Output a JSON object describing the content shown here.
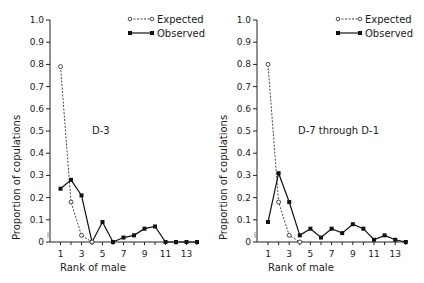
{
  "chart_data": [
    {
      "type": "line",
      "panel_label": "D-3",
      "xlabel": "Rank of male",
      "ylabel": "Proportion of copulations",
      "ylim": [
        0,
        1.0
      ],
      "xlim": [
        1,
        14
      ],
      "yticks": [
        "0",
        "0.1",
        "0.2",
        "0.3",
        "0.4",
        "0.5",
        "0.6",
        "0.7",
        "0.8",
        "0.9",
        "1.0"
      ],
      "xticks": [
        "1",
        "3",
        "5",
        "7",
        "9",
        "11",
        "13"
      ],
      "legend": [
        "Expected",
        "Observed"
      ],
      "legend_position": "upper right",
      "grid": false,
      "series": [
        {
          "name": "Expected",
          "style": "dashed, open circles",
          "x": [
            1,
            2,
            3,
            4
          ],
          "values": [
            0.79,
            0.18,
            0.03,
            0.0
          ]
        },
        {
          "name": "Observed",
          "style": "solid, filled squares",
          "x": [
            1,
            2,
            3,
            4,
            5,
            6,
            7,
            8,
            9,
            10,
            11,
            12,
            13,
            14
          ],
          "values": [
            0.24,
            0.28,
            0.21,
            0.0,
            0.09,
            0.0,
            0.02,
            0.03,
            0.06,
            0.07,
            0.0,
            0.0,
            0.0,
            0.0
          ]
        }
      ]
    },
    {
      "type": "line",
      "panel_label": "D-7 through D-1",
      "xlabel": "Rank of male",
      "ylabel": "Proportion of copulations",
      "ylim": [
        0,
        1.0
      ],
      "xlim": [
        1,
        14
      ],
      "yticks": [
        "0",
        "0.1",
        "0.2",
        "0.3",
        "0.4",
        "0.5",
        "0.6",
        "0.7",
        "0.8",
        "0.9",
        "1.0"
      ],
      "xticks": [
        "1",
        "3",
        "5",
        "7",
        "9",
        "11",
        "13"
      ],
      "legend": [
        "Expected",
        "Observed"
      ],
      "legend_position": "upper right",
      "grid": false,
      "series": [
        {
          "name": "Expected",
          "style": "dashed, open circles",
          "x": [
            1,
            2,
            3,
            4
          ],
          "values": [
            0.8,
            0.18,
            0.03,
            0.0
          ]
        },
        {
          "name": "Observed",
          "style": "solid, filled squares",
          "x": [
            1,
            2,
            3,
            4,
            5,
            6,
            7,
            8,
            9,
            10,
            11,
            12,
            13,
            14
          ],
          "values": [
            0.09,
            0.31,
            0.18,
            0.03,
            0.06,
            0.02,
            0.06,
            0.04,
            0.08,
            0.06,
            0.01,
            0.03,
            0.01,
            0.0
          ]
        }
      ]
    }
  ],
  "panels": [
    {
      "label": "D-3",
      "xlabel": "Rank of male",
      "ylabel": "Proportion of copulations",
      "legend_expected": "Expected",
      "legend_observed": "Observed"
    },
    {
      "label": "D-7 through D-1",
      "xlabel": "Rank of male",
      "ylabel": "Proportion of copulations",
      "legend_expected": "Expected",
      "legend_observed": "Observed"
    }
  ]
}
